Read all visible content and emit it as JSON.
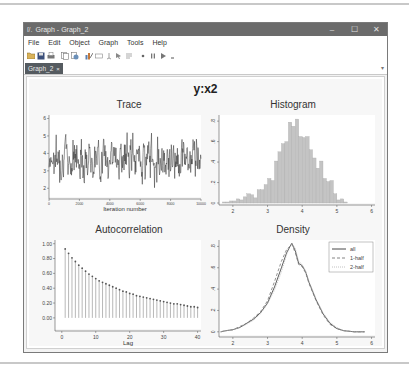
{
  "window": {
    "title": "Graph - Graph_2",
    "app_icon": "stata-icon",
    "controls": {
      "minimize": "–",
      "maximize": "☐",
      "close": "✕"
    }
  },
  "menu": {
    "items": [
      "File",
      "Edit",
      "Object",
      "Graph",
      "Tools",
      "Help"
    ]
  },
  "toolbar": {
    "icons": [
      "open-icon",
      "save-icon",
      "print-icon",
      "copy-icon",
      "copy-special-icon",
      "graph-editor-icon",
      "rename-icon",
      "record-icon",
      "pointer-icon",
      "text-icon",
      "play-icon",
      "pause-icon",
      "play-dropdown-icon"
    ]
  },
  "tabs": [
    {
      "label": "Graph_2",
      "close": "×",
      "active": true
    }
  ],
  "tab_overflow": "▾",
  "graph": {
    "title": "y:x2"
  },
  "chart_data": [
    {
      "type": "line",
      "title": "Trace",
      "xlabel": "Iteration number",
      "ylabel": "",
      "xlim": [
        0,
        10000
      ],
      "ylim": [
        1.5,
        6.2
      ],
      "xticks": [
        0,
        2000,
        4000,
        6000,
        8000,
        10000
      ],
      "yticks": [
        2,
        3,
        4,
        5,
        6
      ],
      "seed": 7,
      "n_points": 400,
      "mean": 3.75,
      "sd": 0.55,
      "color": "#333333"
    },
    {
      "type": "bar",
      "title": "Histogram",
      "xlabel": "",
      "ylabel": "",
      "xlim": [
        1.6,
        6.1
      ],
      "ylim": [
        0,
        0.86
      ],
      "xticks": [
        2,
        3,
        4,
        5,
        6
      ],
      "yticks": [
        0,
        0.2,
        0.4,
        0.6,
        0.8
      ],
      "ytick_labels": [
        "0",
        ".2",
        ".4",
        ".6",
        ".8"
      ],
      "bin_width": 0.1,
      "bin_start": 1.7,
      "values": [
        0.01,
        0.01,
        0.02,
        0.02,
        0.04,
        0.03,
        0.06,
        0.09,
        0.08,
        0.05,
        0.13,
        0.13,
        0.18,
        0.24,
        0.22,
        0.41,
        0.5,
        0.58,
        0.6,
        0.79,
        0.75,
        0.82,
        0.65,
        0.64,
        0.65,
        0.52,
        0.44,
        0.34,
        0.41,
        0.24,
        0.21,
        0.22,
        0.09,
        0.03,
        0.04,
        0.01
      ],
      "fill": "#c4c4c4",
      "stroke": "#a8a8a8"
    },
    {
      "type": "bar",
      "subtype": "stem",
      "title": "Autocorrelation",
      "xlabel": "Lag",
      "ylabel": "",
      "xlim": [
        -2,
        41
      ],
      "ylim": [
        -0.15,
        1.05
      ],
      "xticks": [
        0,
        10,
        20,
        30,
        40
      ],
      "yticks": [
        0,
        0.2,
        0.4,
        0.6,
        0.8,
        1.0
      ],
      "ytick_labels": [
        "0.00",
        "0.20",
        "0.40",
        "0.60",
        "0.80",
        "1.00"
      ],
      "lags": [
        1,
        2,
        3,
        4,
        5,
        6,
        7,
        8,
        9,
        10,
        11,
        12,
        13,
        14,
        15,
        16,
        17,
        18,
        19,
        20,
        21,
        22,
        23,
        24,
        25,
        26,
        27,
        28,
        29,
        30,
        31,
        32,
        33,
        34,
        35,
        36,
        37,
        38,
        39,
        40
      ],
      "values": [
        0.93,
        0.87,
        0.81,
        0.76,
        0.71,
        0.67,
        0.63,
        0.59,
        0.56,
        0.53,
        0.5,
        0.48,
        0.46,
        0.44,
        0.42,
        0.4,
        0.38,
        0.36,
        0.35,
        0.33,
        0.32,
        0.3,
        0.29,
        0.28,
        0.27,
        0.26,
        0.25,
        0.24,
        0.23,
        0.22,
        0.21,
        0.2,
        0.19,
        0.19,
        0.18,
        0.17,
        0.16,
        0.15,
        0.15,
        0.14
      ],
      "color": "#999999"
    },
    {
      "type": "line",
      "title": "Density",
      "xlabel": "",
      "ylabel": "",
      "xlim": [
        1.6,
        6.1
      ],
      "ylim": [
        -0.03,
        0.86
      ],
      "xticks": [
        2,
        3,
        4,
        5,
        6
      ],
      "yticks": [
        0,
        0.2,
        0.4,
        0.6,
        0.8
      ],
      "ytick_labels": [
        "0",
        ".2",
        ".4",
        ".6",
        ".8"
      ],
      "x": [
        1.65,
        1.8,
        2.0,
        2.2,
        2.4,
        2.6,
        2.8,
        3.0,
        3.2,
        3.4,
        3.55,
        3.7,
        3.8,
        3.9,
        4.0,
        4.1,
        4.2,
        4.4,
        4.6,
        4.8,
        5.0,
        5.2,
        5.5,
        5.8
      ],
      "series": [
        {
          "name": "all",
          "dash": "",
          "color": "#333333",
          "values": [
            0.0,
            0.01,
            0.02,
            0.04,
            0.08,
            0.12,
            0.18,
            0.27,
            0.42,
            0.6,
            0.74,
            0.83,
            0.76,
            0.64,
            0.62,
            0.56,
            0.46,
            0.3,
            0.17,
            0.08,
            0.03,
            0.01,
            0.0,
            0.0
          ]
        },
        {
          "name": "1-half",
          "dash": "3,2",
          "color": "#777777",
          "values": [
            0.0,
            0.01,
            0.02,
            0.05,
            0.08,
            0.13,
            0.19,
            0.29,
            0.47,
            0.66,
            0.77,
            0.82,
            0.74,
            0.63,
            0.61,
            0.55,
            0.45,
            0.29,
            0.16,
            0.07,
            0.03,
            0.01,
            0.0,
            0.0
          ]
        },
        {
          "name": "2-half",
          "dash": "1,1",
          "color": "#bbbbbb",
          "values": [
            0.0,
            0.01,
            0.02,
            0.04,
            0.07,
            0.11,
            0.17,
            0.26,
            0.39,
            0.56,
            0.72,
            0.83,
            0.78,
            0.66,
            0.63,
            0.57,
            0.47,
            0.31,
            0.18,
            0.09,
            0.04,
            0.01,
            0.0,
            0.0
          ]
        }
      ],
      "legend": {
        "position": "top-right",
        "entries": [
          "all",
          "1-half",
          "2-half"
        ]
      }
    }
  ]
}
